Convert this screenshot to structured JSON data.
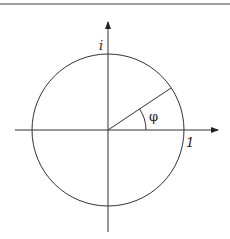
{
  "diagram": {
    "labels": {
      "imaginary_unit": "i",
      "real_unit": "1",
      "angle": "φ"
    },
    "geometry": {
      "center": [
        108,
        130
      ],
      "radius": 76,
      "angle_deg": 34
    },
    "colors": {
      "stroke": "#333333",
      "border": "#a0a0a0"
    }
  }
}
